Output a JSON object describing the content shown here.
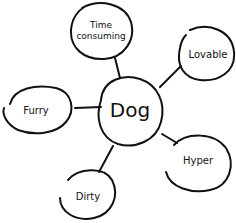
{
  "diagram": {
    "type": "mind-map",
    "center": {
      "label": "Dog"
    },
    "branches": [
      {
        "id": "time-consuming",
        "label_lines": [
          "Time",
          "consuming"
        ]
      },
      {
        "id": "lovable",
        "label": "Lovable"
      },
      {
        "id": "furry",
        "label": "Furry"
      },
      {
        "id": "hyper",
        "label": "Hyper"
      },
      {
        "id": "dirty",
        "label": "Dirty"
      }
    ],
    "colors": {
      "ink": "#111111",
      "background": "#ffffff"
    }
  }
}
